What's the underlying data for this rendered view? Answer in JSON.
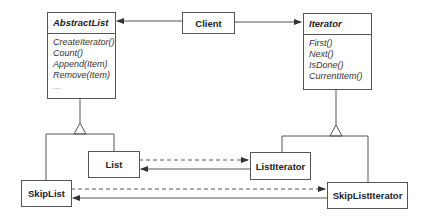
{
  "diagram": {
    "type": "UML class diagram",
    "classes": {
      "abstract_list": {
        "name": "AbstractList",
        "abstract": true,
        "operations": [
          "CreateIterator()",
          "Count()",
          "Append(Item)",
          "Remove(Item)",
          "..."
        ]
      },
      "client": {
        "name": "Client"
      },
      "iterator": {
        "name": "Iterator",
        "abstract": true,
        "operations": [
          "First()",
          "Next()",
          "IsDone()",
          "CurrentItem()"
        ]
      },
      "list": {
        "name": "List"
      },
      "list_iterator": {
        "name": "ListIterator"
      },
      "skip_list": {
        "name": "SkipList"
      },
      "skip_list_iterator": {
        "name": "SkipListIterator"
      }
    },
    "relationships": [
      {
        "from": "Client",
        "to": "AbstractList",
        "kind": "association"
      },
      {
        "from": "Client",
        "to": "Iterator",
        "kind": "association"
      },
      {
        "from": "List",
        "to": "AbstractList",
        "kind": "inheritance"
      },
      {
        "from": "SkipList",
        "to": "AbstractList",
        "kind": "inheritance"
      },
      {
        "from": "ListIterator",
        "to": "Iterator",
        "kind": "inheritance"
      },
      {
        "from": "SkipListIterator",
        "to": "Iterator",
        "kind": "inheritance"
      },
      {
        "from": "List",
        "to": "ListIterator",
        "kind": "creates (dashed)"
      },
      {
        "from": "ListIterator",
        "to": "List",
        "kind": "association"
      },
      {
        "from": "SkipList",
        "to": "SkipListIterator",
        "kind": "creates (dashed)"
      },
      {
        "from": "SkipListIterator",
        "to": "SkipList",
        "kind": "association"
      }
    ],
    "colors": {
      "line": "#555555",
      "text": "#222222",
      "background": "#ffffff"
    }
  }
}
